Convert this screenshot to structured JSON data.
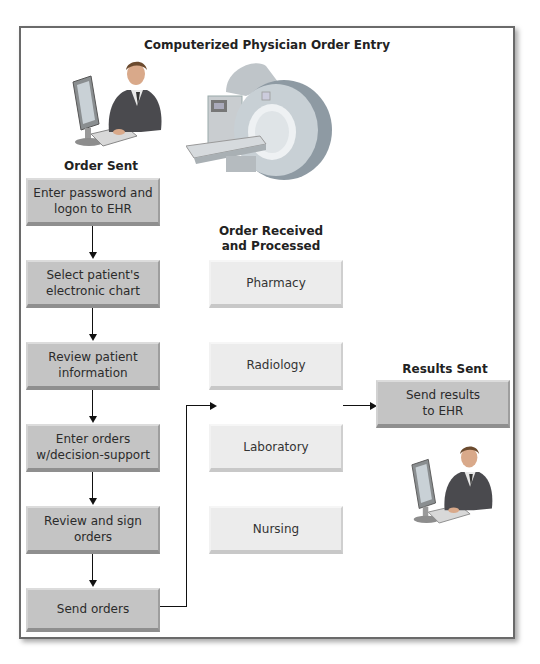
{
  "title": "Computerized Physician Order Entry",
  "columns": {
    "order_sent": {
      "heading": "Order Sent",
      "steps": [
        {
          "label": "Enter password and logon to EHR"
        },
        {
          "label": "Select patient's electronic chart"
        },
        {
          "label": "Review patient information"
        },
        {
          "label": "Enter orders w/decision-support"
        },
        {
          "label": "Review and sign orders"
        },
        {
          "label": "Send orders"
        }
      ]
    },
    "order_received": {
      "heading_line1": "Order Received",
      "heading_line2": "and Processed",
      "departments": [
        {
          "label": "Pharmacy"
        },
        {
          "label": "Radiology"
        },
        {
          "label": "Laboratory"
        },
        {
          "label": "Nursing"
        }
      ]
    },
    "results_sent": {
      "heading": "Results Sent",
      "step": {
        "label_line1": "Send results",
        "label_line2": "to EHR"
      }
    }
  },
  "illustrations": {
    "top_left": "physician-at-computer",
    "top_center": "mri-scanner",
    "bottom_right": "physician-at-computer"
  },
  "colors": {
    "step_box": "#c4c4c4",
    "department_box": "#ececec",
    "frame_border": "#6a6a6a",
    "arrow": "#111111"
  }
}
